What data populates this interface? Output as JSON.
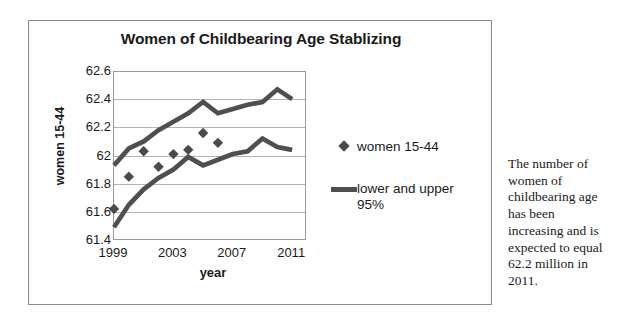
{
  "figure": {
    "side_note": "The number of women of childbearing age has been increasing and is expected to equal 62.2 million in 2011."
  },
  "legend": {
    "series_label": "women 15-44",
    "band_label": "lower and upper 95%"
  },
  "colors": {
    "marker": "#4a4a4a",
    "band_line": "#4f4f4f",
    "gridline": "#b4b4b4",
    "axis": "#9a9a9a",
    "frame": "#8a8a8a",
    "text": "#1a1a1a"
  },
  "chart_data": {
    "type": "line",
    "title": "Women of Childbearing Age Stablizing",
    "xlabel": "year",
    "ylabel": "women 15-44",
    "xlim": [
      1999,
      2012
    ],
    "ylim": [
      61.4,
      62.6
    ],
    "ytick_labels": [
      "62.6",
      "62.4",
      "62.2",
      "62",
      "61.8",
      "61.6",
      "61.4"
    ],
    "yticks": [
      62.6,
      62.4,
      62.2,
      62.0,
      61.8,
      61.6,
      61.4
    ],
    "xtick_labels": [
      "1999",
      "2003",
      "2007",
      "2011"
    ],
    "xticks": [
      1999,
      2003,
      2007,
      2011
    ],
    "grid": true,
    "legend_position": "right",
    "series": [
      {
        "name": "women 15-44",
        "style": "markers",
        "marker": "diamond",
        "x": [
          1999,
          2000,
          2001,
          2002,
          2003,
          2004,
          2005,
          2006
        ],
        "values": [
          61.62,
          61.85,
          62.03,
          61.92,
          62.01,
          62.04,
          62.16,
          62.09
        ]
      },
      {
        "name": "upper 95%",
        "style": "line",
        "x": [
          1999,
          2000,
          2001,
          2002,
          2003,
          2004,
          2005,
          2006,
          2007,
          2008,
          2009,
          2010,
          2011
        ],
        "values": [
          61.93,
          62.05,
          62.1,
          62.18,
          62.24,
          62.3,
          62.38,
          62.3,
          62.33,
          62.36,
          62.38,
          62.47,
          62.4
        ]
      },
      {
        "name": "lower 95%",
        "style": "line",
        "x": [
          1999,
          2000,
          2001,
          2002,
          2003,
          2004,
          2005,
          2006,
          2007,
          2008,
          2009,
          2010,
          2011
        ],
        "values": [
          61.49,
          61.65,
          61.76,
          61.84,
          61.9,
          61.99,
          61.93,
          61.97,
          62.01,
          62.03,
          62.12,
          62.06,
          62.04
        ]
      }
    ]
  }
}
